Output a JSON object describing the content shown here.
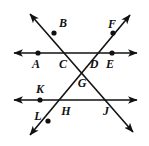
{
  "figure": {
    "name": "two-transversals-crossing-two-parallel-lines",
    "width": 149,
    "height": 146,
    "background_color": "#ffffff",
    "stroke_color": "#111111",
    "labels": {
      "A": "A",
      "B": "B",
      "C": "C",
      "D": "D",
      "E": "E",
      "F": "F",
      "G": "G",
      "H": "H",
      "J": "J",
      "K": "K",
      "L": "L"
    },
    "label_positions": [
      {
        "id": "A",
        "x": 36,
        "y": 64
      },
      {
        "id": "B",
        "x": 63,
        "y": 23
      },
      {
        "id": "C",
        "x": 63,
        "y": 64
      },
      {
        "id": "D",
        "x": 94,
        "y": 64
      },
      {
        "id": "E",
        "x": 110,
        "y": 64
      },
      {
        "id": "F",
        "x": 112,
        "y": 24
      },
      {
        "id": "G",
        "x": 82,
        "y": 83
      },
      {
        "id": "H",
        "x": 66,
        "y": 111
      },
      {
        "id": "J",
        "x": 106,
        "y": 111
      },
      {
        "id": "K",
        "x": 40,
        "y": 89
      },
      {
        "id": "L",
        "x": 38,
        "y": 116
      }
    ],
    "lines": [
      {
        "id": "line-top-horizontal",
        "kind": "horizontal",
        "x1": 14,
        "y1": 53,
        "x2": 137,
        "y2": 53,
        "arrow_start": true,
        "arrow_end": true
      },
      {
        "id": "line-bottom-horizontal",
        "kind": "horizontal",
        "x1": 14,
        "y1": 100,
        "x2": 137,
        "y2": 100,
        "arrow_start": true,
        "arrow_end": true
      },
      {
        "id": "line-transversal-bc-gj",
        "kind": "transversal",
        "x1": 30,
        "y1": 14,
        "x2": 133,
        "y2": 132,
        "arrow_start": true,
        "arrow_end": true
      },
      {
        "id": "line-transversal-lh-gdf",
        "kind": "transversal",
        "x1": 30,
        "y1": 135,
        "x2": 130,
        "y2": 15,
        "arrow_start": true,
        "arrow_end": true
      }
    ],
    "dots": [
      {
        "id": "A",
        "x": 38,
        "y": 53
      },
      {
        "id": "B",
        "x": 54,
        "y": 33
      },
      {
        "id": "E",
        "x": 112,
        "y": 53
      },
      {
        "id": "F",
        "x": 113,
        "y": 33
      },
      {
        "id": "K",
        "x": 40,
        "y": 100
      },
      {
        "id": "L",
        "x": 48,
        "y": 121
      }
    ]
  }
}
